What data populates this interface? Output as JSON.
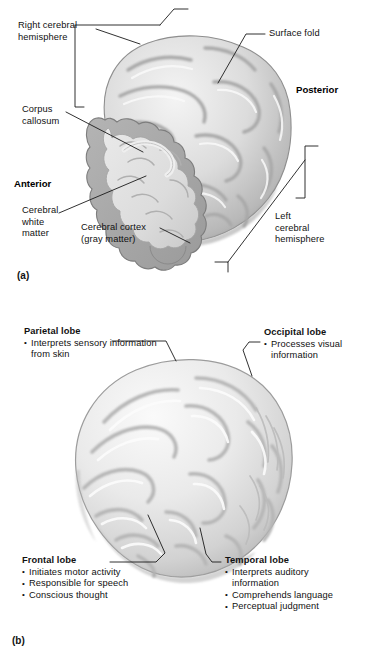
{
  "figure": {
    "background_color": "#ffffff",
    "ink_color": "#1a1a1a"
  },
  "panel_a": {
    "label": "(a)",
    "illustration_name": "cerebrum-cutaway-illustration",
    "directions": [
      {
        "name": "anterior",
        "text": "Anterior"
      },
      {
        "name": "posterior",
        "text": "Posterior"
      }
    ],
    "callouts": [
      {
        "name": "right-cerebral-hemisphere",
        "line1": "Right cerebral",
        "line2": "hemisphere"
      },
      {
        "name": "corpus-callosum",
        "line1": "Corpus",
        "line2": "callosum"
      },
      {
        "name": "cerebral-white-matter",
        "line1": "Cerebral",
        "line2": "white",
        "line3": "matter"
      },
      {
        "name": "cerebral-cortex",
        "line1": "Cerebral cortex",
        "line2": "(gray matter)"
      },
      {
        "name": "surface-fold",
        "line1": "Surface fold"
      },
      {
        "name": "left-cerebral-hemisphere",
        "line1": "Left",
        "line2": "cerebral",
        "line3": "hemisphere"
      }
    ]
  },
  "panel_b": {
    "label": "(b)",
    "illustration_name": "cerebral-lobes-illustration",
    "lobes": [
      {
        "name": "parietal-lobe",
        "heading": "Parietal lobe",
        "functions": [
          "Interprets sensory information from skin"
        ]
      },
      {
        "name": "occipital-lobe",
        "heading": "Occipital lobe",
        "functions": [
          "Processes visual information"
        ]
      },
      {
        "name": "frontal-lobe",
        "heading": "Frontal lobe",
        "functions": [
          "Initiates motor activity",
          "Responsible for speech",
          "Conscious thought"
        ]
      },
      {
        "name": "temporal-lobe",
        "heading": "Temporal lobe",
        "functions": [
          "Interprets auditory information",
          "Comprehends language",
          "Perceptual judgment"
        ]
      }
    ]
  }
}
